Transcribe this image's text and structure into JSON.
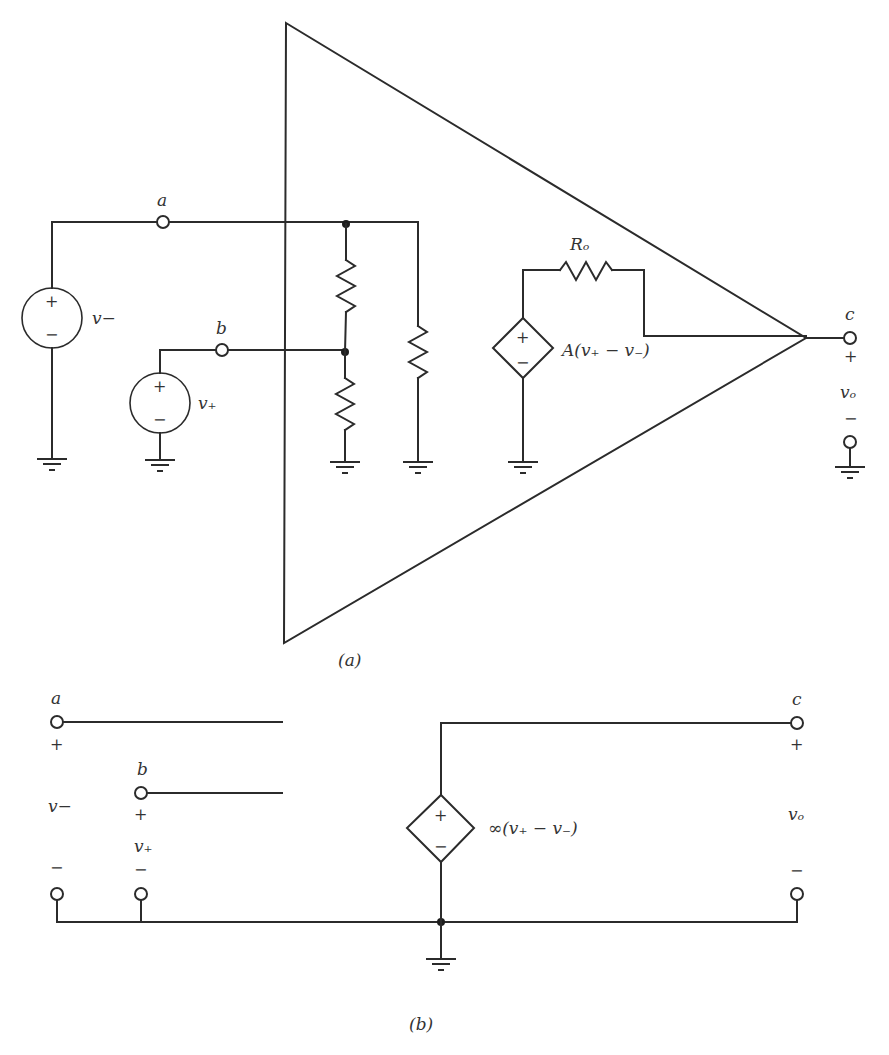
{
  "figure": {
    "part_a": {
      "caption": "(a)",
      "node_labels": {
        "a": "a",
        "b": "b",
        "c": "c"
      },
      "sources": {
        "v_minus": {
          "label": "v−",
          "plus": "+",
          "minus": "−"
        },
        "v_plus": {
          "label": "v₊",
          "plus": "+",
          "minus": "−"
        },
        "dependent": {
          "label": "A(v₊ − v₋)",
          "plus": "+",
          "minus": "−"
        }
      },
      "resistor_labels": {
        "output": "Rₒ"
      },
      "output": {
        "plus": "+",
        "label": "vₒ",
        "minus": "−"
      }
    },
    "part_b": {
      "caption": "(b)",
      "node_labels": {
        "a": "a",
        "b": "b",
        "c": "c"
      },
      "input_a": {
        "plus": "+",
        "label": "v−",
        "minus": "−"
      },
      "input_b": {
        "plus": "+",
        "label": "v₊",
        "minus": "−"
      },
      "dependent": {
        "label": "∞(v₊ − v₋)",
        "plus": "+",
        "minus": "−"
      },
      "output": {
        "plus": "+",
        "label": "vₒ",
        "minus": "−"
      }
    },
    "colors": {
      "ink": "#2b2b2b",
      "background": "#ffffff"
    }
  }
}
